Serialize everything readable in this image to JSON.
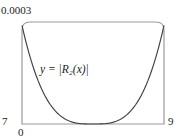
{
  "chart_data": {
    "type": "line",
    "title": "",
    "xlabel": "",
    "ylabel": "",
    "xlim": [
      7,
      9
    ],
    "ylim": [
      0,
      0.0003
    ],
    "grid": false,
    "tick_labels": {
      "x_min": "0",
      "x_left_corner": "7",
      "x_max": "9",
      "y_max": "0.0003"
    },
    "annotation": "y = |R₂(x)|",
    "series": [
      {
        "name": "y = |R2(x)|",
        "x": [
          7.0,
          7.2,
          7.4,
          7.6,
          7.8,
          8.0,
          8.2,
          8.4,
          8.6,
          8.8,
          9.0
        ],
        "values": [
          0.00029,
          0.00013,
          5e-05,
          1.3e-05,
          1.5e-06,
          0.0,
          1.5e-06,
          1.3e-05,
          5e-05,
          0.00013,
          0.00029
        ]
      }
    ],
    "colors": {
      "curve": "#444444",
      "frame": "#999999"
    }
  }
}
